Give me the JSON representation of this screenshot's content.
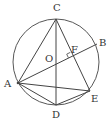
{
  "diagram": {
    "title": "",
    "stroke_color": "#444444",
    "circle": {
      "name": "circle-O",
      "cx": 56,
      "cy": 62,
      "r": 43
    },
    "points": [
      {
        "id": "C",
        "label": "C",
        "x": 56,
        "y": 19,
        "lx": 53,
        "ly": 11
      },
      {
        "id": "D",
        "label": "D",
        "x": 56,
        "y": 105,
        "lx": 52,
        "ly": 118
      },
      {
        "id": "A",
        "label": "A",
        "x": 18,
        "y": 83,
        "lx": 4,
        "ly": 87
      },
      {
        "id": "B",
        "label": "B",
        "x": 97,
        "y": 44,
        "lx": 99,
        "ly": 46
      },
      {
        "id": "E",
        "label": "E",
        "x": 90,
        "y": 91,
        "lx": 91,
        "ly": 102
      },
      {
        "id": "O",
        "label": "O",
        "x": 56,
        "y": 62,
        "lx": 45,
        "ly": 62
      },
      {
        "id": "F",
        "label": "F",
        "x": 72,
        "y": 56,
        "lx": 71,
        "ly": 53
      }
    ],
    "segments": [
      [
        "C",
        "A"
      ],
      [
        "C",
        "D"
      ],
      [
        "C",
        "E"
      ],
      [
        "A",
        "B"
      ],
      [
        "A",
        "D"
      ],
      [
        "A",
        "E"
      ],
      [
        "D",
        "E"
      ]
    ],
    "right_angle_at": "F"
  }
}
